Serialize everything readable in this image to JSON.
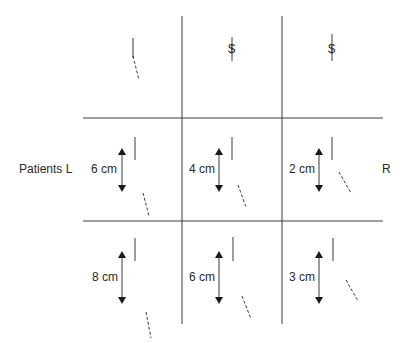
{
  "diagram": {
    "row_label_left": "Patients L",
    "row_label_right": "R",
    "grid": {
      "columns": 3,
      "rows": 3
    },
    "cells": [
      {
        "row": 0,
        "col": 0,
        "symbol": "",
        "measurement": "",
        "marker": "line-with-dashed-tail"
      },
      {
        "row": 0,
        "col": 1,
        "symbol": "$",
        "measurement": "",
        "marker": "dollar-on-line"
      },
      {
        "row": 0,
        "col": 2,
        "symbol": "$",
        "measurement": "",
        "marker": "dollar-on-line"
      },
      {
        "row": 1,
        "col": 0,
        "symbol": "",
        "measurement": "6 cm",
        "marker": "double-arrow"
      },
      {
        "row": 1,
        "col": 1,
        "symbol": "",
        "measurement": "4 cm",
        "marker": "double-arrow"
      },
      {
        "row": 1,
        "col": 2,
        "symbol": "",
        "measurement": "2 cm",
        "marker": "double-arrow"
      },
      {
        "row": 2,
        "col": 0,
        "symbol": "",
        "measurement": "8 cm",
        "marker": "double-arrow"
      },
      {
        "row": 2,
        "col": 1,
        "symbol": "",
        "measurement": "6 cm",
        "marker": "double-arrow"
      },
      {
        "row": 2,
        "col": 2,
        "symbol": "",
        "measurement": "3 cm",
        "marker": "double-arrow"
      }
    ],
    "colors": {
      "line": "#3a3a3a",
      "text": "#2a2a2a"
    }
  }
}
